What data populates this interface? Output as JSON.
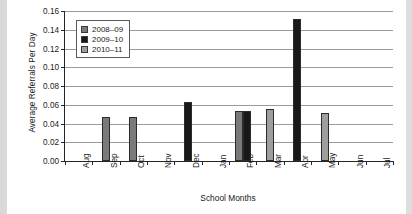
{
  "chart_data": {
    "type": "bar",
    "title": "",
    "xlabel": "School Months",
    "ylabel": "Average Referrals Per Day",
    "ylim": [
      0,
      0.16
    ],
    "ytick_labels": [
      "0.16",
      "0.14",
      "0.12",
      "0.10",
      "0.08",
      "0.06",
      "0.04",
      "0.02",
      "0.00"
    ],
    "ytick_values": [
      0.16,
      0.14,
      0.12,
      0.1,
      0.08,
      0.06,
      0.04,
      0.02,
      0.0
    ],
    "grid": "horizontal",
    "legend_position": "top-left",
    "categories": [
      "Aug",
      "Sep",
      "Oct",
      "Nov",
      "Dec",
      "Jan",
      "Feb",
      "Mar",
      "Apr",
      "May",
      "Jun",
      "Jul"
    ],
    "series": [
      {
        "name": "2008–09",
        "color": "#7a7a7a",
        "values": [
          0,
          0.047,
          0.047,
          0,
          0,
          0,
          0.053,
          0,
          0,
          0,
          0,
          0
        ]
      },
      {
        "name": "2009–10",
        "color": "#181818",
        "values": [
          0,
          0,
          0,
          0,
          0.063,
          0,
          0.053,
          0,
          0.151,
          0,
          0,
          0
        ]
      },
      {
        "name": "2010–11",
        "color": "#9e9e9e",
        "values": [
          0,
          0,
          0,
          0,
          0,
          0,
          0,
          0.056,
          0,
          0.051,
          0,
          0
        ]
      }
    ]
  },
  "legend": {
    "items": [
      {
        "label": "2008–09"
      },
      {
        "label": "2009–10"
      },
      {
        "label": "2010–11"
      }
    ]
  }
}
